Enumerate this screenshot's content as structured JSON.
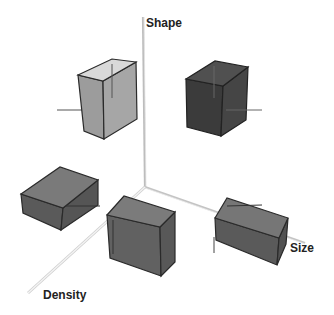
{
  "diagram": {
    "type": "3d-feature-space",
    "axes": {
      "vertical": {
        "label": "Shape"
      },
      "horizontal": {
        "label": "Size"
      },
      "depth": {
        "label": "Density"
      }
    },
    "objects": [
      {
        "id": "box-top-left",
        "description": "tall light gray box",
        "shade": "light"
      },
      {
        "id": "box-top-right",
        "description": "tall dark box",
        "shade": "dark"
      },
      {
        "id": "box-mid-left",
        "description": "flat wide medium gray box",
        "shade": "medium"
      },
      {
        "id": "box-center",
        "description": "square medium gray box",
        "shade": "medium"
      },
      {
        "id": "box-right",
        "description": "wide medium gray box",
        "shade": "medium"
      }
    ],
    "colors": {
      "axis": "#c8c8c8",
      "edge": "#2a2a2a",
      "light_front": "#9a9a9a",
      "light_side": "#a8a8a8",
      "light_top": "#d8d8d8",
      "dark_front": "#3a3a3a",
      "dark_side": "#444444",
      "dark_top": "#505050",
      "medium_front": "#5e5e5e",
      "medium_side": "#555555",
      "medium_top": "#7a7a7a"
    }
  }
}
